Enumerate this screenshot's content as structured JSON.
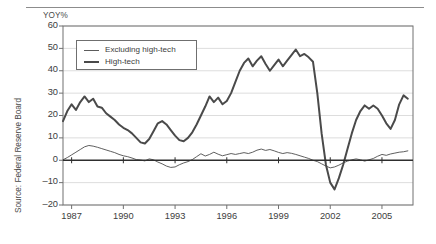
{
  "chart_data": {
    "type": "line",
    "title": "",
    "subtitle": "",
    "xlabel": "",
    "ylabel": "YOY%",
    "unit_label": "YOY%",
    "source": "Source: Federal Reserve Board",
    "grid": true,
    "legend_position": "top-left-inside",
    "xlim": [
      1986.5,
      2006.8
    ],
    "ylim": [
      -20,
      60
    ],
    "yticks": [
      60,
      50,
      40,
      30,
      20,
      10,
      0,
      -10,
      -20
    ],
    "ytick_labels": [
      "60",
      "50",
      "40",
      "30",
      "20",
      "10",
      "0",
      "–10",
      "–20"
    ],
    "xticks": [
      1987,
      1990,
      1993,
      1996,
      1999,
      2002,
      2005
    ],
    "xtick_labels": [
      "1987",
      "1990",
      "1993",
      "1996",
      "1999",
      "2002",
      "2005"
    ],
    "zero_line": 0,
    "series": [
      {
        "name": "Excluding high-tech",
        "style": "thin",
        "color": "#4d4d4d",
        "x": [
          1986.5,
          1986.75,
          1987.0,
          1987.25,
          1987.5,
          1987.75,
          1988.0,
          1988.25,
          1988.5,
          1988.75,
          1989.0,
          1989.25,
          1989.5,
          1989.75,
          1990.0,
          1990.25,
          1990.5,
          1990.75,
          1991.0,
          1991.25,
          1991.5,
          1991.75,
          1992.0,
          1992.25,
          1992.5,
          1992.75,
          1993.0,
          1993.25,
          1993.5,
          1993.75,
          1994.0,
          1994.25,
          1994.5,
          1994.75,
          1995.0,
          1995.25,
          1995.5,
          1995.75,
          1996.0,
          1996.25,
          1996.5,
          1996.75,
          1997.0,
          1997.25,
          1997.5,
          1997.75,
          1998.0,
          1998.25,
          1998.5,
          1998.75,
          1999.0,
          1999.25,
          1999.5,
          1999.75,
          2000.0,
          2000.25,
          2000.5,
          2000.75,
          2001.0,
          2001.25,
          2001.5,
          2001.75,
          2002.0,
          2002.25,
          2002.5,
          2002.75,
          2003.0,
          2003.25,
          2003.5,
          2003.75,
          2004.0,
          2004.25,
          2004.5,
          2004.75,
          2005.0,
          2005.25,
          2005.5,
          2005.75,
          2006.0,
          2006.25,
          2006.5
        ],
        "y": [
          0.2,
          1.2,
          2.4,
          3.6,
          4.8,
          6.0,
          6.6,
          6.3,
          5.8,
          5.2,
          4.6,
          4.0,
          3.4,
          2.6,
          2.0,
          1.6,
          1.0,
          0.3,
          0.1,
          -0.3,
          0.6,
          0.2,
          -0.8,
          -1.6,
          -2.6,
          -3.2,
          -3.0,
          -2.0,
          -1.2,
          -0.6,
          0.3,
          1.6,
          2.9,
          1.9,
          2.6,
          3.6,
          2.7,
          2.0,
          2.5,
          3.0,
          2.6,
          3.0,
          3.4,
          3.0,
          3.6,
          4.5,
          5.0,
          4.4,
          4.8,
          4.2,
          3.5,
          3.0,
          3.4,
          3.1,
          2.6,
          2.0,
          1.4,
          0.8,
          0.0,
          -0.6,
          -1.6,
          -2.6,
          -3.4,
          -3.0,
          -2.2,
          -1.2,
          -0.4,
          0.2,
          0.6,
          0.2,
          -0.4,
          0.2,
          0.8,
          1.8,
          2.6,
          2.2,
          2.8,
          3.2,
          3.6,
          3.8,
          4.2
        ]
      },
      {
        "name": "High-tech",
        "style": "thick",
        "color": "#4a4a4a",
        "x": [
          1986.5,
          1986.75,
          1987.0,
          1987.25,
          1987.5,
          1987.75,
          1988.0,
          1988.25,
          1988.5,
          1988.75,
          1989.0,
          1989.25,
          1989.5,
          1989.75,
          1990.0,
          1990.25,
          1990.5,
          1990.75,
          1991.0,
          1991.25,
          1991.5,
          1991.75,
          1992.0,
          1992.25,
          1992.5,
          1992.75,
          1993.0,
          1993.25,
          1993.5,
          1993.75,
          1994.0,
          1994.25,
          1994.5,
          1994.75,
          1995.0,
          1995.25,
          1995.5,
          1995.75,
          1996.0,
          1996.25,
          1996.5,
          1996.75,
          1997.0,
          1997.25,
          1997.5,
          1997.75,
          1998.0,
          1998.25,
          1998.5,
          1998.75,
          1999.0,
          1999.25,
          1999.5,
          1999.75,
          2000.0,
          2000.25,
          2000.5,
          2000.75,
          2001.0,
          2001.25,
          2001.5,
          2001.75,
          2002.0,
          2002.25,
          2002.5,
          2002.75,
          2003.0,
          2003.25,
          2003.5,
          2003.75,
          2004.0,
          2004.25,
          2004.5,
          2004.75,
          2005.0,
          2005.25,
          2005.5,
          2005.75,
          2006.0,
          2006.25,
          2006.5
        ],
        "y": [
          17.5,
          22.0,
          25.0,
          22.5,
          26.0,
          28.5,
          26.0,
          27.5,
          24.0,
          23.5,
          21.0,
          19.5,
          18.0,
          16.0,
          14.5,
          13.5,
          12.0,
          10.0,
          8.0,
          7.5,
          9.5,
          13.0,
          16.5,
          17.5,
          16.0,
          13.5,
          11.0,
          9.0,
          8.5,
          10.0,
          12.5,
          16.0,
          20.0,
          24.0,
          28.5,
          26.0,
          28.0,
          25.0,
          26.5,
          30.0,
          35.0,
          40.0,
          43.5,
          45.5,
          42.0,
          44.5,
          46.5,
          43.0,
          40.0,
          42.5,
          45.0,
          42.0,
          44.5,
          47.0,
          49.5,
          46.5,
          47.5,
          46.0,
          44.0,
          30.0,
          12.0,
          -2.0,
          -10.0,
          -13.0,
          -8.0,
          -2.0,
          5.0,
          12.0,
          18.0,
          22.0,
          24.5,
          23.0,
          24.5,
          23.0,
          20.0,
          16.5,
          14.0,
          18.0,
          25.0,
          29.0,
          27.5
        ]
      }
    ]
  }
}
